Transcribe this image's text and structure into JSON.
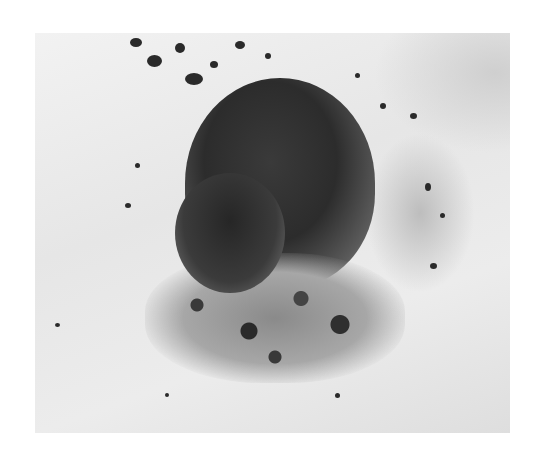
{
  "image": {
    "subject": "small rodent emerging from snow",
    "alt": "A dark-furred vole peeking out of a hole in the snow, surrounded by scattered dirt"
  }
}
